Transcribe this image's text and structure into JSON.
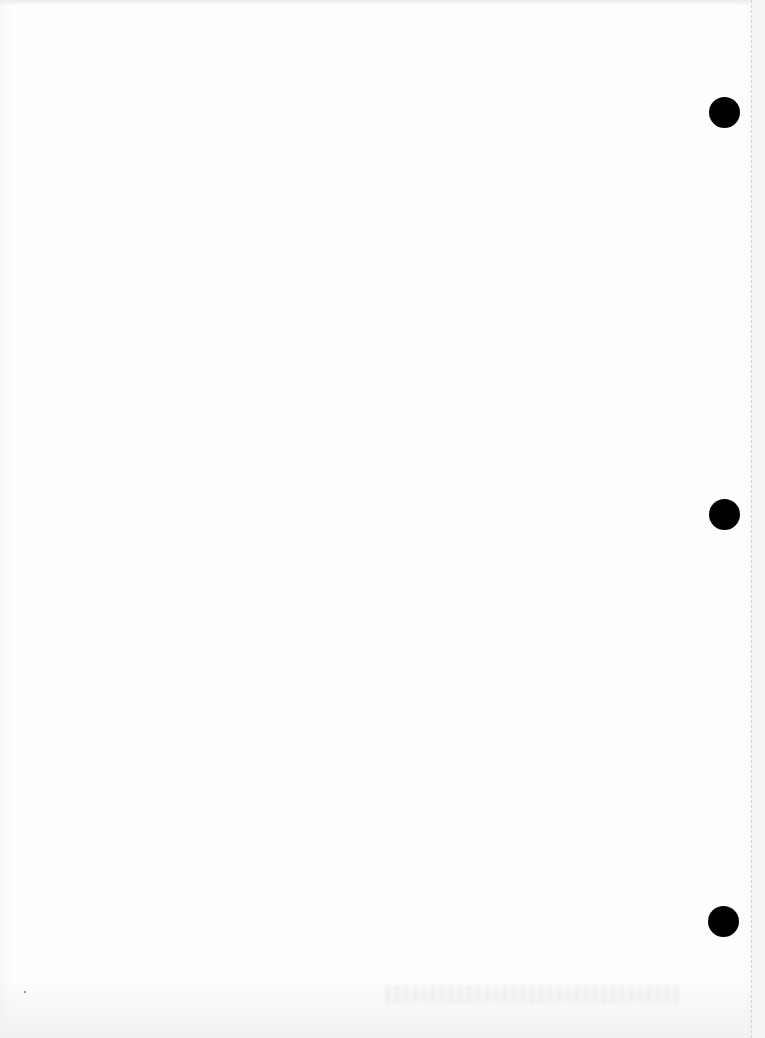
{
  "document": {
    "type": "blank scanned loose-leaf page",
    "content_text": "",
    "background_color": "#fdfdfd"
  },
  "punch_holes": [
    {
      "name": "top",
      "cx": 724,
      "cy": 112,
      "diameter": 31,
      "color": "#000000"
    },
    {
      "name": "middle",
      "cx": 724,
      "cy": 514,
      "diameter": 31,
      "color": "#000000"
    },
    {
      "name": "bottom",
      "cx": 723,
      "cy": 921,
      "diameter": 31,
      "color": "#000000"
    }
  ],
  "edge": {
    "perforation_line_x": 751
  }
}
